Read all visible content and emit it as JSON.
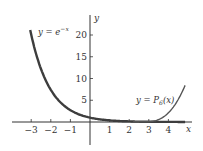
{
  "chart_data": {
    "type": "line",
    "title": "",
    "xlabel": "x",
    "ylabel": "y",
    "xlim": [
      -3.1,
      4.9
    ],
    "ylim": [
      -5,
      25
    ],
    "grid": false,
    "x_ticks": [
      -3,
      -2,
      -1,
      1,
      2,
      3,
      4
    ],
    "x_tick_labels": [
      "−3",
      "−2",
      "−1",
      "1",
      "2",
      "3",
      "4"
    ],
    "y_ticks": [
      5,
      10,
      15,
      20
    ],
    "y_tick_labels": [
      "5",
      "10",
      "15",
      "20"
    ],
    "series": [
      {
        "name": "y = e^{-x}",
        "label": "y = e",
        "label_sup": "−x",
        "x": [
          -3,
          -2.5,
          -2,
          -1.5,
          -1,
          -0.5,
          0,
          1,
          2,
          3,
          4,
          4.8
        ],
        "values": [
          20.09,
          12.18,
          7.39,
          4.48,
          2.72,
          1.65,
          1.0,
          0.37,
          0.14,
          0.05,
          0.02,
          0.01
        ]
      },
      {
        "name": "y = P_6(x)",
        "label": "y = P",
        "label_sub": "6",
        "label_tail": "(x)",
        "x": [
          -3,
          -2,
          -1,
          0,
          1,
          2,
          3,
          3.5,
          4,
          4.5,
          4.8
        ],
        "values": [
          20.09,
          7.36,
          2.72,
          1.0,
          0.37,
          0.16,
          0.25,
          0.9,
          2.6,
          5.4,
          8.2
        ]
      }
    ],
    "annotations": [
      {
        "text": "y = e^{-x}",
        "near": [
          -2.2,
          22
        ]
      },
      {
        "text": "y = P_6(x)",
        "near": [
          3.6,
          5
        ]
      }
    ]
  }
}
